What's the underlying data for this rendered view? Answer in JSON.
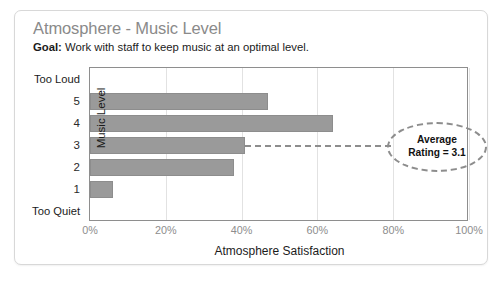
{
  "card": {
    "title": "Atmosphere - Music Level",
    "goal_label": "Goal:",
    "goal_text": " Work with staff to keep music at an optimal level."
  },
  "annotation": {
    "line1": "Average",
    "line2": "Rating = 3.1"
  },
  "colors": {
    "bar": "#9a9a9a",
    "bar_border": "#8d8d8d",
    "axis": "#8e8e8e",
    "grid": "#e2e2e2",
    "title": "#8a8a8a",
    "tick": "#8d8d8d",
    "card_border": "#d8d8d8"
  },
  "chart_data": {
    "type": "bar",
    "orientation": "horizontal",
    "title": "Atmosphere - Music Level",
    "subtitle": "Goal: Work with staff to keep music at an optimal level.",
    "xlabel": "Atmosphere Satisfaction",
    "ylabel": "Music Level",
    "categories": [
      "Too Loud",
      "5",
      "4",
      "3",
      "2",
      "1",
      "Too Quiet"
    ],
    "values": [
      0,
      47,
      64,
      41,
      38,
      6,
      0
    ],
    "xlim": [
      0,
      100
    ],
    "xticks": [
      0,
      20,
      40,
      60,
      80,
      100
    ],
    "xticklabels": [
      "0%",
      "20%",
      "40%",
      "60%",
      "80%",
      "100%"
    ],
    "grid": "vertical",
    "legend": "none",
    "annotations": [
      {
        "text": "Average Rating = 3.1",
        "attached_to_category": "3",
        "shape": "dashed-ellipse"
      }
    ]
  }
}
